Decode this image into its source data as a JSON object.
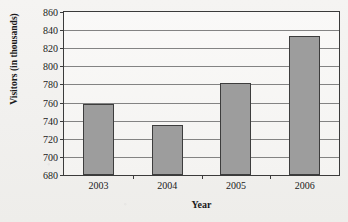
{
  "chart_data": {
    "type": "bar",
    "title": "VISITATION AT ARCHES NATIONAL PARK 2003–2006",
    "xlabel": "Year",
    "ylabel": "Visitors (in thousands)",
    "categories": [
      "2003",
      "2004",
      "2005",
      "2006"
    ],
    "values": [
      758,
      735,
      782,
      834
    ],
    "ylim": [
      680,
      860
    ],
    "yticks": [
      680,
      700,
      720,
      740,
      760,
      780,
      800,
      820,
      840,
      860
    ],
    "ytick_labels": [
      "680",
      "700",
      "720",
      "740",
      "760",
      "780",
      "800",
      "820",
      "840",
      "860"
    ],
    "grid": true,
    "legend": "none",
    "series": [
      {
        "name": "Visitors (in thousands)",
        "values": [
          758,
          735,
          782,
          834
        ]
      }
    ],
    "bar_color": "#9d9d9d",
    "bar_edge_color": "#3d3d3d",
    "axis_color": "#3b3b3b",
    "grid_color": "#6e6e6e",
    "background_color": "#f3f2f0"
  }
}
